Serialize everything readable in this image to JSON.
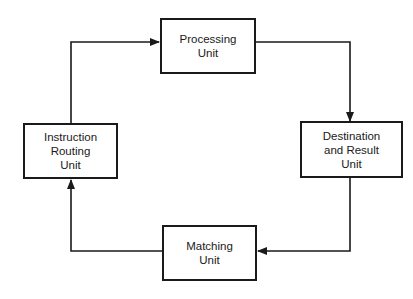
{
  "diagram": {
    "type": "cycle-flowchart",
    "nodes": [
      {
        "id": "processing",
        "label_lines": [
          "Processing",
          "Unit"
        ]
      },
      {
        "id": "destination",
        "label_lines": [
          "Destination",
          "and Result",
          "Unit"
        ]
      },
      {
        "id": "matching",
        "label_lines": [
          "Matching",
          "Unit"
        ]
      },
      {
        "id": "instruction",
        "label_lines": [
          "Instruction",
          "Routing",
          "Unit"
        ]
      }
    ],
    "edges": [
      {
        "from": "instruction",
        "to": "processing"
      },
      {
        "from": "processing",
        "to": "destination"
      },
      {
        "from": "destination",
        "to": "matching"
      },
      {
        "from": "matching",
        "to": "instruction"
      }
    ],
    "colors": {
      "stroke": "#1a1a1a",
      "background": "#ffffff"
    }
  }
}
